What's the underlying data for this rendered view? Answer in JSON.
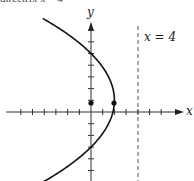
{
  "caption_fragment": "directrix x = 4",
  "labels": {
    "x_axis": "x",
    "y_axis": "y",
    "directrix": "x = 4"
  },
  "chart_data": {
    "type": "diagram",
    "equation": "(y - 1)^2 = -8(x - 2)",
    "vertex": [
      2,
      1
    ],
    "focus": [
      0,
      1
    ],
    "directrix": "x = 4",
    "opens": "left",
    "marked_points": [
      [
        0,
        1
      ],
      [
        2,
        1
      ]
    ],
    "y_intercepts": [
      5,
      -3
    ],
    "xlabel": "x",
    "ylabel": "y",
    "x_ticks": [
      -6,
      -5,
      -4,
      -3,
      -2,
      -1,
      1,
      2,
      3,
      4,
      5,
      6
    ],
    "y_ticks": [
      -5,
      -4,
      -3,
      -2,
      -1,
      1,
      2,
      3,
      4,
      5,
      6,
      7
    ],
    "xlim": [
      -7,
      7
    ],
    "ylim": [
      -6,
      8
    ],
    "grid": false
  },
  "colors": {
    "curve": "#111111",
    "axis": "#333333",
    "directrix": "#555555"
  }
}
